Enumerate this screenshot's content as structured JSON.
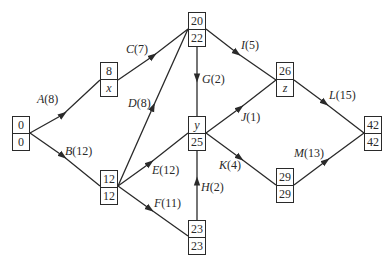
{
  "nodes": [
    {
      "id": "n0",
      "top": "0",
      "bottom": "0",
      "x": 12,
      "y": 116
    },
    {
      "id": "n1",
      "top": "8",
      "bottom": "x",
      "x": 100,
      "y": 62
    },
    {
      "id": "n2",
      "top": "20",
      "bottom": "22",
      "x": 188,
      "y": 12
    },
    {
      "id": "n3",
      "top": "12",
      "bottom": "12",
      "x": 100,
      "y": 170
    },
    {
      "id": "n4",
      "top": "y",
      "bottom": "25",
      "x": 188,
      "y": 116
    },
    {
      "id": "n5",
      "top": "23",
      "bottom": "23",
      "x": 188,
      "y": 220
    },
    {
      "id": "n6",
      "top": "26",
      "bottom": "z",
      "x": 276,
      "y": 62
    },
    {
      "id": "n7",
      "top": "29",
      "bottom": "29",
      "x": 276,
      "y": 168
    },
    {
      "id": "n8",
      "top": "42",
      "bottom": "42",
      "x": 364,
      "y": 116
    }
  ],
  "activities": [
    {
      "name": "A",
      "duration": "(8)",
      "from": "n0",
      "to": "n1"
    },
    {
      "name": "B",
      "duration": "(12)",
      "from": "n0",
      "to": "n3"
    },
    {
      "name": "C",
      "duration": "(7)",
      "from": "n1",
      "to": "n2"
    },
    {
      "name": "D",
      "duration": "(8)",
      "from": "n3",
      "to": "n2"
    },
    {
      "name": "E",
      "duration": "(12)",
      "from": "n3",
      "to": "n4"
    },
    {
      "name": "F",
      "duration": "(11)",
      "from": "n3",
      "to": "n5"
    },
    {
      "name": "G",
      "duration": "(2)",
      "from": "n2",
      "to": "n4"
    },
    {
      "name": "H",
      "duration": "(2)",
      "from": "n5",
      "to": "n4"
    },
    {
      "name": "I",
      "duration": "(5)",
      "from": "n2",
      "to": "n6"
    },
    {
      "name": "J",
      "duration": "(1)",
      "from": "n4",
      "to": "n6"
    },
    {
      "name": "K",
      "duration": "(4)",
      "from": "n4",
      "to": "n7"
    },
    {
      "name": "L",
      "duration": "(15)",
      "from": "n6",
      "to": "n8"
    },
    {
      "name": "M",
      "duration": "(13)",
      "from": "n7",
      "to": "n8"
    }
  ],
  "colors": {
    "line": "#2a2a2a",
    "background": "#ffffff"
  }
}
